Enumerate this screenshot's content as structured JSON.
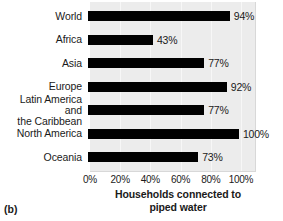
{
  "figure": {
    "panel_label": "(b)",
    "axis_title": "Households connected to\npiped water"
  },
  "chart_data": {
    "type": "bar",
    "orientation": "horizontal",
    "title": "",
    "subtitle": "",
    "xlabel": "Households connected to piped water",
    "ylabel": "",
    "categories": [
      "World",
      "Africa",
      "Asia",
      "Europe",
      "Latin America and\nthe Caribbean",
      "North America",
      "Oceania"
    ],
    "values": [
      94,
      43,
      77,
      92,
      77,
      100,
      73
    ],
    "value_labels": [
      "94%",
      "43%",
      "77%",
      "92%",
      "77%",
      "100%",
      "73%"
    ],
    "xlim": [
      0,
      110
    ],
    "xticks": [
      0,
      20,
      40,
      60,
      80,
      100
    ],
    "xtick_labels": [
      "0%",
      "20%",
      "40%",
      "60%",
      "80%",
      "100%"
    ],
    "grid": true,
    "legend": "none",
    "bar_color": "#000000",
    "plot_background": "#ececec",
    "figure_background": "#ffffff"
  }
}
